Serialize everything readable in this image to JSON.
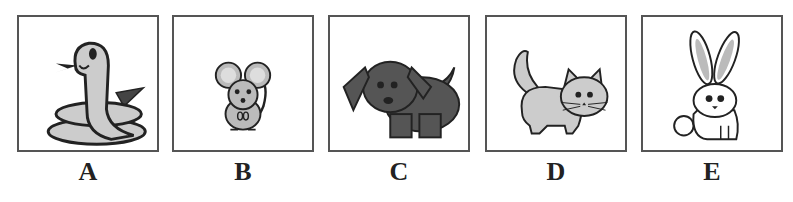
{
  "options": [
    {
      "letter": "A",
      "animal": "snake",
      "icon": "snake-icon"
    },
    {
      "letter": "B",
      "animal": "mouse",
      "icon": "mouse-icon"
    },
    {
      "letter": "C",
      "animal": "dog",
      "icon": "dog-icon"
    },
    {
      "letter": "D",
      "animal": "cat",
      "icon": "cat-icon"
    },
    {
      "letter": "E",
      "animal": "rabbit",
      "icon": "rabbit-icon"
    }
  ],
  "colors": {
    "border": "#555555",
    "light_fill": "#c8c8c8",
    "dark_fill": "#555555",
    "outline": "#222222"
  }
}
